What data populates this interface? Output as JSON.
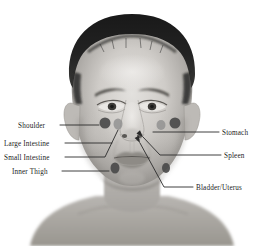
{
  "figure": {
    "type": "anatomical-diagram",
    "image_style": "grayscale photograph",
    "background_color": "#ffffff"
  },
  "colors": {
    "marker_dark": "#4a4a4a",
    "marker_light": "#8d8d8d",
    "leader_line": "#2a2a2a",
    "label_text": "#1b1b1b",
    "background": "#ffffff"
  },
  "labels": {
    "left": [
      {
        "id": "shoulder",
        "text": "Shoulder",
        "x": 18,
        "y": 122
      },
      {
        "id": "large-intestine",
        "text": "Large Intestine",
        "x": 4,
        "y": 140
      },
      {
        "id": "small-intestine",
        "text": "Small Intestine",
        "x": 4,
        "y": 154
      },
      {
        "id": "inner-thigh",
        "text": "Inner Thigh",
        "x": 12,
        "y": 168
      }
    ],
    "right": [
      {
        "id": "stomach",
        "text": "Stomach",
        "x": 222,
        "y": 129
      },
      {
        "id": "spleen",
        "text": "Spleen",
        "x": 224,
        "y": 152
      },
      {
        "id": "bladder-uterus",
        "text": "Bladder/Uterus",
        "x": 196,
        "y": 184
      }
    ]
  },
  "markers": [
    {
      "id": "shoulder-point",
      "label": "Shoulder",
      "cx": 105,
      "cy": 123,
      "rx": 5.5,
      "ry": 5.5,
      "tone": "dark"
    },
    {
      "id": "small-intestine-point",
      "label": "Small Intestine",
      "cx": 118,
      "cy": 124,
      "rx": 4.5,
      "ry": 5.5,
      "tone": "light"
    },
    {
      "id": "stomach-point",
      "label": "Stomach",
      "cx": 161,
      "cy": 125,
      "rx": 4.5,
      "ry": 5.0,
      "tone": "light"
    },
    {
      "id": "shoulder-point-right",
      "label": "Shoulder",
      "cx": 175,
      "cy": 123,
      "rx": 5.5,
      "ry": 5.5,
      "tone": "dark"
    },
    {
      "id": "inner-thigh-point",
      "label": "Inner Thigh",
      "cx": 115,
      "cy": 168,
      "rx": 4.5,
      "ry": 5.5,
      "tone": "dark"
    },
    {
      "id": "inner-thigh-point-right",
      "label": "Inner Thigh",
      "cx": 166,
      "cy": 168,
      "rx": 4.0,
      "ry": 5.0,
      "tone": "dark"
    }
  ],
  "leader_lines": [
    {
      "id": "leader-shoulder",
      "label": "Shoulder",
      "points": "60,125 99,125"
    },
    {
      "id": "leader-large-intestine",
      "label": "Large Intestine",
      "points": "65,143 112,143"
    },
    {
      "id": "leader-small-intestine",
      "label": "Small Intestine",
      "points": "65,157 105,157 118,130"
    },
    {
      "id": "leader-inner-thigh",
      "label": "Inner Thigh",
      "points": "62,171 109,171"
    },
    {
      "id": "leader-stomach",
      "label": "Stomach",
      "points": "219,132 153,132"
    },
    {
      "id": "leader-spleen",
      "label": "Spleen",
      "points": "221,155 160,155 143,137"
    },
    {
      "id": "leader-bladder-uterus",
      "label": "Bladder/Uterus",
      "points": "193,187 164,187 140,143"
    }
  ],
  "arrow_heads": [
    {
      "id": "arrow-spleen",
      "label": "Spleen",
      "x": 143,
      "y": 137,
      "angle": -133
    },
    {
      "id": "arrow-bladder-uterus",
      "label": "Bladder/Uterus",
      "x": 140,
      "y": 143,
      "angle": -118
    }
  ]
}
